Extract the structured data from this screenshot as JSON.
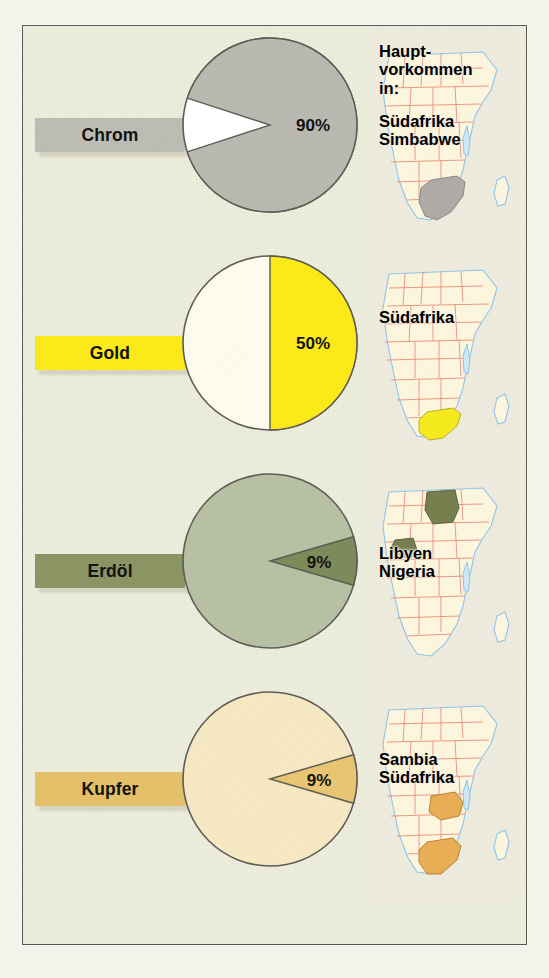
{
  "poster": {
    "background_color": "#eeeede",
    "frame_color": "#55564f",
    "title_header": {
      "line1": "Haupt-",
      "line2": "vorkommen",
      "line3": "in:"
    }
  },
  "chart_data": {
    "type": "pie",
    "xlabel": "",
    "ylabel": "",
    "legend_position": "left-chip",
    "grid": false,
    "series": [
      {
        "name": "Chrom",
        "value": 90,
        "value_label": "90%",
        "remainder": 10,
        "fill_color": "#b9b9b1",
        "remainder_color": "#ffffff",
        "chip_color": "#bcbcb4",
        "countries": [
          "Südafrika",
          "Simbabwe"
        ]
      },
      {
        "name": "Gold",
        "value": 50,
        "value_label": "50%",
        "remainder": 50,
        "fill_color": "#fbe918",
        "remainder_color": "#fdfbee",
        "chip_color": "#fbe918",
        "countries": [
          "Südafrika"
        ]
      },
      {
        "name": "Erdöl",
        "value": 9,
        "value_label": "9%",
        "remainder": 91,
        "fill_color": "#7f8a5a",
        "remainder_color": "#b7c0a2",
        "chip_color": "#8b9463",
        "countries": [
          "Libyen",
          "Nigeria"
        ]
      },
      {
        "name": "Kupfer",
        "value": 9,
        "value_label": "9%",
        "remainder": 91,
        "fill_color": "#e8c572",
        "remainder_color": "#f7e8c4",
        "chip_color": "#e5c06a",
        "countries": [
          "Sambia",
          "Südafrika"
        ]
      }
    ]
  },
  "rows": [
    {
      "label": "Chrom",
      "percent_label": "90%",
      "chip_color": "#bcbcb4",
      "pie_main_color": "#b9b9b1",
      "pie_slice_color": "#ffffff",
      "map_highlight_color": "#b0aaa6",
      "map_line1": "Südafrika",
      "map_line2": "Simbabwe",
      "map_icon": "africa-map-icon"
    },
    {
      "label": "Gold",
      "percent_label": "50%",
      "chip_color": "#fbe918",
      "pie_main_color": "#fdfbee",
      "pie_slice_color": "#fbe918",
      "map_highlight_color": "#f5ea1c",
      "map_line1": "Südafrika",
      "map_line2": "",
      "map_icon": "africa-map-icon"
    },
    {
      "label": "Erdöl",
      "percent_label": "9%",
      "chip_color": "#8b9463",
      "pie_main_color": "#b7c0a2",
      "pie_slice_color": "#7f8a5a",
      "map_highlight_color": "#757f4e",
      "map_line1": "Libyen",
      "map_line2": "Nigeria",
      "map_icon": "africa-map-icon"
    },
    {
      "label": "Kupfer",
      "percent_label": "9%",
      "chip_color": "#e5c06a",
      "pie_main_color": "#f7e8c4",
      "pie_slice_color": "#e8c572",
      "map_highlight_color": "#e9ae55",
      "map_line1": "Sambia",
      "map_line2": "Südafrika",
      "map_icon": "africa-map-icon"
    }
  ]
}
